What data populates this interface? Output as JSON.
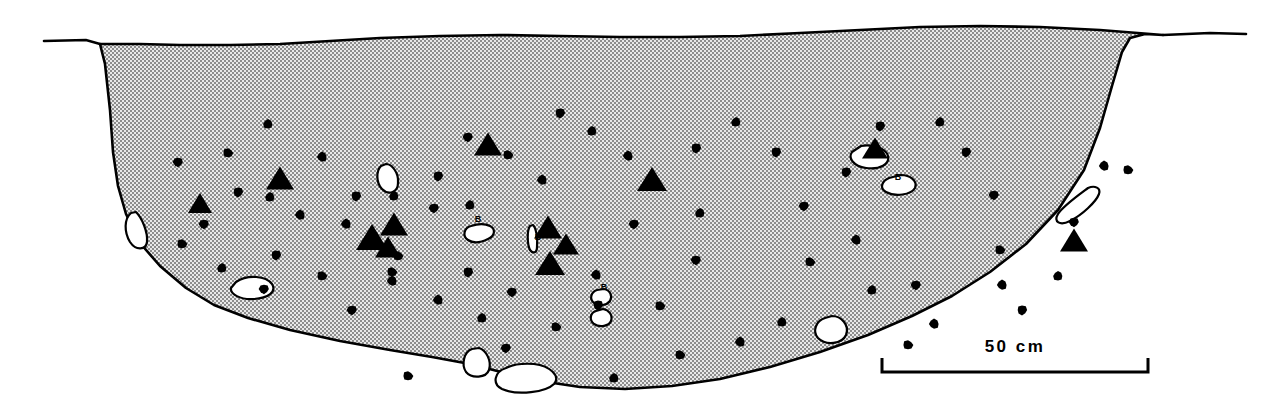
{
  "figure": {
    "type": "archaeological-section-drawing",
    "title": "",
    "background_color": "#ffffff",
    "ink_color": "#000000",
    "fill_pattern": "stipple-halftone",
    "fill_tone_color": "#9a9a9a"
  },
  "scale_bar": {
    "label": "50 cm",
    "x_start": 882,
    "x_end": 1148,
    "y": 372,
    "tick_height": 14,
    "line_width": 3
  },
  "ground_line": {
    "left_segment_path": "M 44,41 L 86,40 L 100,44",
    "right_segment_path": "M 1163,35 L 1210,33 L 1246,34"
  },
  "pit_outline": {
    "description": "stippled pit fill profile",
    "path": "M 100,44 L 105,64 L 110,110 L 113,152 L 118,186 L 126,214 L 140,243 L 160,266 L 186,288 L 214,305 L 248,318 L 290,330 L 340,341 L 390,350 L 432,357 L 470,364 L 505,373 L 540,381 L 580,387 L 625,389 L 672,386 L 720,379 L 770,367 L 820,352 L 868,335 L 912,316 L 952,296 L 990,272 L 1026,244 L 1058,210 L 1084,170 L 1100,128 L 1112,86 L 1122,52 L 1130,38 L 1145,34 L 1163,35 L 1163,35 L 1100,30 L 1040,27 L 980,26 L 920,27 L 860,30 L 800,33 L 740,36 L 680,37 L 620,37 L 560,36 L 500,35 L 440,36 L 380,38 L 330,41 L 280,44 L 230,45 L 180,45 L 140,44 Z"
  },
  "artifacts": {
    "legend_note": "solid dots = charcoal/pebbles, solid triangles = lithics, white outlines = bone/shell, B = bone",
    "dots": [
      {
        "cx": 268,
        "cy": 124,
        "r": 5
      },
      {
        "cx": 178,
        "cy": 162,
        "r": 5
      },
      {
        "cx": 228,
        "cy": 153,
        "r": 5
      },
      {
        "cx": 322,
        "cy": 157,
        "r": 5
      },
      {
        "cx": 238,
        "cy": 192,
        "r": 5
      },
      {
        "cx": 270,
        "cy": 197,
        "r": 5
      },
      {
        "cx": 204,
        "cy": 224,
        "r": 5
      },
      {
        "cx": 182,
        "cy": 244,
        "r": 5
      },
      {
        "cx": 300,
        "cy": 215,
        "r": 5
      },
      {
        "cx": 276,
        "cy": 255,
        "r": 5
      },
      {
        "cx": 222,
        "cy": 268,
        "r": 5
      },
      {
        "cx": 264,
        "cy": 289,
        "r": 5
      },
      {
        "cx": 322,
        "cy": 276,
        "r": 5
      },
      {
        "cx": 346,
        "cy": 224,
        "r": 5
      },
      {
        "cx": 356,
        "cy": 196,
        "r": 5
      },
      {
        "cx": 394,
        "cy": 196,
        "r": 5
      },
      {
        "cx": 434,
        "cy": 208,
        "r": 5
      },
      {
        "cx": 398,
        "cy": 256,
        "r": 5
      },
      {
        "cx": 392,
        "cy": 281,
        "r": 5
      },
      {
        "cx": 438,
        "cy": 176,
        "r": 5
      },
      {
        "cx": 470,
        "cy": 205,
        "r": 5
      },
      {
        "cx": 352,
        "cy": 310,
        "r": 5
      },
      {
        "cx": 408,
        "cy": 376,
        "r": 5
      },
      {
        "cx": 438,
        "cy": 300,
        "r": 5
      },
      {
        "cx": 468,
        "cy": 272,
        "r": 5
      },
      {
        "cx": 482,
        "cy": 318,
        "r": 5
      },
      {
        "cx": 512,
        "cy": 292,
        "r": 5
      },
      {
        "cx": 508,
        "cy": 155,
        "r": 5
      },
      {
        "cx": 542,
        "cy": 180,
        "r": 5
      },
      {
        "cx": 560,
        "cy": 113,
        "r": 5
      },
      {
        "cx": 592,
        "cy": 131,
        "r": 5
      },
      {
        "cx": 506,
        "cy": 348,
        "r": 5
      },
      {
        "cx": 556,
        "cy": 327,
        "r": 5
      },
      {
        "cx": 596,
        "cy": 275,
        "r": 5
      },
      {
        "cx": 598,
        "cy": 305,
        "r": 5
      },
      {
        "cx": 614,
        "cy": 378,
        "r": 5
      },
      {
        "cx": 634,
        "cy": 224,
        "r": 5
      },
      {
        "cx": 660,
        "cy": 306,
        "r": 5
      },
      {
        "cx": 628,
        "cy": 156,
        "r": 5
      },
      {
        "cx": 696,
        "cy": 148,
        "r": 5
      },
      {
        "cx": 700,
        "cy": 213,
        "r": 5
      },
      {
        "cx": 696,
        "cy": 260,
        "r": 5
      },
      {
        "cx": 680,
        "cy": 355,
        "r": 5
      },
      {
        "cx": 740,
        "cy": 342,
        "r": 5
      },
      {
        "cx": 776,
        "cy": 152,
        "r": 5
      },
      {
        "cx": 782,
        "cy": 322,
        "r": 5
      },
      {
        "cx": 804,
        "cy": 206,
        "r": 5
      },
      {
        "cx": 810,
        "cy": 262,
        "r": 5
      },
      {
        "cx": 856,
        "cy": 240,
        "r": 5
      },
      {
        "cx": 846,
        "cy": 172,
        "r": 5
      },
      {
        "cx": 872,
        "cy": 290,
        "r": 5
      },
      {
        "cx": 916,
        "cy": 285,
        "r": 5
      },
      {
        "cx": 908,
        "cy": 345,
        "r": 5
      },
      {
        "cx": 934,
        "cy": 324,
        "r": 5
      },
      {
        "cx": 966,
        "cy": 152,
        "r": 5
      },
      {
        "cx": 940,
        "cy": 122,
        "r": 5
      },
      {
        "cx": 994,
        "cy": 195,
        "r": 5
      },
      {
        "cx": 1000,
        "cy": 250,
        "r": 5
      },
      {
        "cx": 1002,
        "cy": 285,
        "r": 5
      },
      {
        "cx": 1022,
        "cy": 310,
        "r": 5
      },
      {
        "cx": 1058,
        "cy": 276,
        "r": 5
      },
      {
        "cx": 1074,
        "cy": 222,
        "r": 5
      },
      {
        "cx": 1128,
        "cy": 170,
        "r": 5
      },
      {
        "cx": 1104,
        "cy": 166,
        "r": 5
      },
      {
        "cx": 880,
        "cy": 126,
        "r": 5
      },
      {
        "cx": 736,
        "cy": 122,
        "r": 5
      },
      {
        "cx": 468,
        "cy": 137,
        "r": 5
      },
      {
        "cx": 392,
        "cy": 272,
        "r": 5
      }
    ],
    "triangles": [
      {
        "cx": 200,
        "cy": 203,
        "w": 24,
        "h": 20
      },
      {
        "cx": 280,
        "cy": 178,
        "w": 28,
        "h": 23
      },
      {
        "cx": 372,
        "cy": 237,
        "w": 32,
        "h": 26
      },
      {
        "cx": 394,
        "cy": 224,
        "w": 28,
        "h": 23
      },
      {
        "cx": 388,
        "cy": 247,
        "w": 26,
        "h": 21
      },
      {
        "cx": 488,
        "cy": 144,
        "w": 28,
        "h": 23
      },
      {
        "cx": 548,
        "cy": 227,
        "w": 28,
        "h": 23
      },
      {
        "cx": 566,
        "cy": 244,
        "w": 26,
        "h": 21
      },
      {
        "cx": 550,
        "cy": 263,
        "w": 30,
        "h": 24
      },
      {
        "cx": 652,
        "cy": 179,
        "w": 30,
        "h": 24
      },
      {
        "cx": 875,
        "cy": 148,
        "w": 26,
        "h": 21
      },
      {
        "cx": 1074,
        "cy": 240,
        "w": 28,
        "h": 23
      }
    ],
    "white_inclusions": [
      {
        "name": "stone-left-edge",
        "path": "M 131,213 C 124,219 124,232 130,242 C 136,251 146,250 147,242 C 148,232 142,218 136,212 Z"
      },
      {
        "name": "stone-left-lower",
        "path": "M 236,282 C 248,274 266,276 272,284 C 277,292 268,298 254,299 C 240,300 230,294 231,288 Z"
      },
      {
        "name": "bone-upper-left",
        "path": "M 381,166 C 376,171 376,183 382,189 C 389,196 398,192 398,183 C 399,173 392,164 386,164 Z"
      },
      {
        "name": "bone-center-b",
        "path": "M 471,226 C 464,228 462,236 468,240 C 474,244 482,242 488,239 C 495,236 496,229 490,226 C 484,223 477,224 471,226 Z"
      },
      {
        "name": "sliver-center",
        "path": "M 530,226 C 527,230 527,244 530,250 C 533,254 537,253 537,247 C 538,238 536,228 533,225 Z"
      },
      {
        "name": "bone-lower-center-1",
        "path": "M 597,290 C 591,292 589,299 594,303 C 599,307 607,305 610,301 C 613,296 610,290 604,289 Z"
      },
      {
        "name": "bone-lower-center-2",
        "path": "M 596,311 C 590,313 589,320 594,324 C 600,328 609,326 611,321 C 613,315 609,310 603,309 Z"
      },
      {
        "name": "pebble-bottom-left",
        "path": "M 472,349 C 464,352 461,364 466,372 C 472,379 486,378 489,370 C 492,361 486,350 479,348 Z"
      },
      {
        "name": "pebble-bottom-elongated",
        "path": "M 506,368 C 494,372 492,384 502,389 C 518,396 546,392 554,384 C 561,376 550,366 534,364 C 521,363 512,365 506,368 Z"
      },
      {
        "name": "stone-right-mid",
        "path": "M 825,318 C 816,321 812,331 818,338 C 826,346 842,344 846,335 C 850,325 841,316 832,316 Z"
      },
      {
        "name": "bone-upper-right",
        "path": "M 852,152 C 848,158 853,166 866,168 C 880,170 890,164 888,156 C 886,148 872,144 861,146 Z"
      },
      {
        "name": "bone-right-b",
        "path": "M 889,178 C 882,181 879,188 886,192 C 895,197 911,195 915,188 C 918,181 910,175 901,175 Z"
      },
      {
        "name": "sliver-right-edge",
        "path": "M 1088,188 C 1080,194 1063,206 1058,214 C 1053,222 1060,226 1070,221 C 1082,215 1096,202 1099,194 C 1101,188 1095,185 1088,188 Z"
      }
    ],
    "bone_labels": [
      {
        "text": "B",
        "x": 478,
        "y": 222
      },
      {
        "text": "B",
        "x": 898,
        "y": 180
      },
      {
        "text": "B",
        "x": 604,
        "y": 290
      },
      {
        "text": "B",
        "x": 538,
        "y": 240
      }
    ]
  }
}
